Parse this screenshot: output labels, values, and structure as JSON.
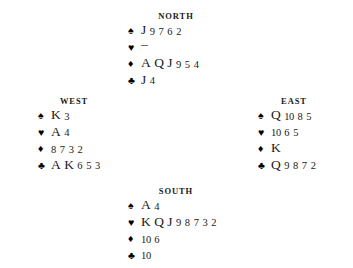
{
  "diagram": {
    "type": "bridge-hand-diagram",
    "background_color": "#ffffff",
    "text_color": "#1a1a1a",
    "suit_symbols": {
      "spades": "♠",
      "hearts": "♥",
      "diamonds": "♦",
      "clubs": "♣"
    },
    "void_marker": "–"
  },
  "hands": {
    "north": {
      "label": "NORTH",
      "spades": "J 9 7 6 2",
      "hearts": "–",
      "diamonds": "A Q J 9 5 4",
      "clubs": "J 4"
    },
    "west": {
      "label": "WEST",
      "spades": "K 3",
      "hearts": "A 4",
      "diamonds": "8 7 3 2",
      "clubs": "A K 6 5 3"
    },
    "east": {
      "label": "EAST",
      "spades": "Q 10 8 5",
      "hearts": "10 6 5",
      "diamonds": "K",
      "clubs": "Q 9 8 7 2"
    },
    "south": {
      "label": "SOUTH",
      "spades": "A 4",
      "hearts": "K Q J 9 8 7 3 2",
      "diamonds": "10 6",
      "clubs": "10"
    }
  }
}
